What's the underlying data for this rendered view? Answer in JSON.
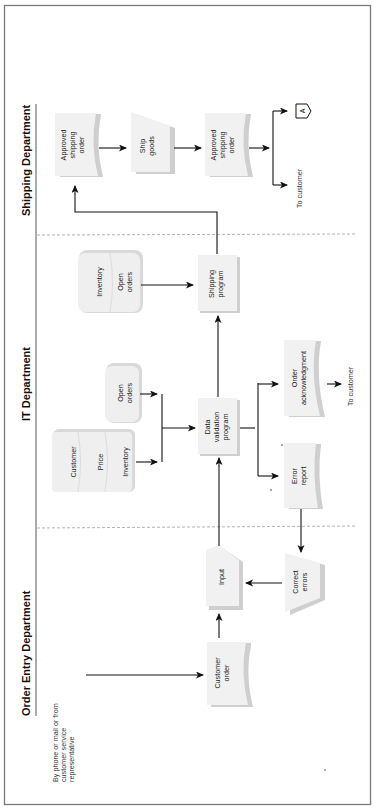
{
  "diagram": {
    "type": "cross-functional flowchart",
    "orientation": "rotated 90 degrees counter-clockwise",
    "lanes": [
      {
        "id": "order-entry",
        "label": "Order Entry Department"
      },
      {
        "id": "it",
        "label": "IT Department"
      },
      {
        "id": "shipping",
        "label": "Shipping Department"
      }
    ],
    "nodes": {
      "source_note": [
        "By phone or mail or from",
        "customer service",
        "representative"
      ],
      "customer_order": [
        "Customer",
        "order"
      ],
      "input": [
        "Input"
      ],
      "correct_errors": [
        "Correct",
        "errors"
      ],
      "db_customer": [
        "Customer"
      ],
      "db_price": [
        "Price"
      ],
      "db_inventory": [
        "Inventory"
      ],
      "db_open_orders": [
        "Open",
        "orders"
      ],
      "data_validation": [
        "Data",
        "validation",
        "program"
      ],
      "error_report": [
        "Error",
        "report"
      ],
      "order_ack": [
        "Order",
        "acknowledgment"
      ],
      "to_customer_ack": [
        "To customer"
      ],
      "db_inventory2": [
        "Inventory"
      ],
      "db_open_orders2": [
        "Open",
        "orders"
      ],
      "shipping_program": [
        "Shipping",
        "program"
      ],
      "approved_order_1": [
        "Approved",
        "shipping",
        "order"
      ],
      "ship_goods": [
        "Ship",
        "goods"
      ],
      "approved_order_2": [
        "Approved",
        "shipping",
        "order"
      ],
      "to_customer_ship": [
        "To customer"
      ],
      "connector": "A"
    },
    "edges": [
      {
        "from": "source_note",
        "to": "customer_order"
      },
      {
        "from": "customer_order",
        "to": "input"
      },
      {
        "from": "correct_errors",
        "to": "input"
      },
      {
        "from": "input",
        "to": "data_validation"
      },
      {
        "from": "db_customer/db_price/db_inventory",
        "to": "data_validation"
      },
      {
        "from": "db_open_orders",
        "to": "data_validation"
      },
      {
        "from": "data_validation",
        "to": "error_report"
      },
      {
        "from": "data_validation",
        "to": "order_ack"
      },
      {
        "from": "order_ack",
        "to": "to_customer_ack"
      },
      {
        "from": "error_report",
        "to": "correct_errors"
      },
      {
        "from": "data_validation",
        "to": "shipping_program"
      },
      {
        "from": "db_inventory2/db_open_orders2",
        "to": "shipping_program"
      },
      {
        "from": "shipping_program",
        "to": "approved_order_1"
      },
      {
        "from": "approved_order_1",
        "to": "ship_goods"
      },
      {
        "from": "ship_goods",
        "to": "approved_order_2"
      },
      {
        "from": "approved_order_2",
        "to": "connector"
      },
      {
        "from": "approved_order_2",
        "to": "to_customer_ship"
      }
    ]
  }
}
